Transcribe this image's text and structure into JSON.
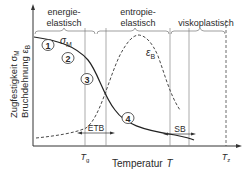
{
  "diagram": {
    "y_axis_label_line1": "Zugfestigkeit σ",
    "y_axis_label_line1_sub": "M",
    "y_axis_label_line2": "Bruchdehnung ε",
    "y_axis_label_line2_sub": "B",
    "x_axis_label": "Temperatur",
    "x_axis_symbol": "T",
    "regions": [
      {
        "line1": "energie-",
        "line2": "elastisch"
      },
      {
        "line1": "entropie-",
        "line2": "elastisch"
      },
      {
        "line1": "viskoplastisch",
        "line2": ""
      }
    ],
    "curves": {
      "strength": {
        "label": "σ",
        "sub": "M"
      },
      "elongation": {
        "label": "ε",
        "sub": "B"
      }
    },
    "markers": [
      "1",
      "2",
      "3",
      "4"
    ],
    "ranges": [
      {
        "label": "ETB"
      },
      {
        "label": "SB"
      }
    ],
    "x_ticks": [
      {
        "label": "T",
        "sub": "g"
      },
      {
        "label": "T",
        "sub": "z"
      }
    ]
  }
}
